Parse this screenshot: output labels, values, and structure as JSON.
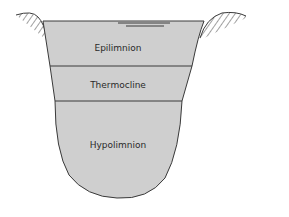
{
  "diagram": {
    "layers": [
      {
        "name": "epilimnion",
        "label": "Epilimnion"
      },
      {
        "name": "thermocline",
        "label": "Thermocline"
      },
      {
        "name": "hypolimnion",
        "label": "Hypolimnion"
      }
    ],
    "colors": {
      "water": "#cfcfcf",
      "outline": "#3a3a3a",
      "hatch": "#444444",
      "background": "#ffffff"
    }
  }
}
